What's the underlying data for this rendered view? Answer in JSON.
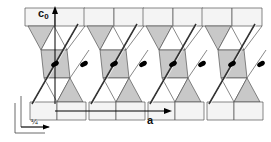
{
  "figure": {
    "type": "crystal-structure-polyhedral-projection",
    "axis_labels": {
      "c_axis": "c",
      "c_axis_subscript": "0",
      "a_axis": "a",
      "fraction_label": "¼"
    },
    "colors": {
      "shaded_polyhedra": "#c8c8c8",
      "light_polyhedra": "#f4f4f4",
      "edges": "#555555",
      "cation_ellipses": "#000000",
      "axes": "#000000"
    },
    "repeat_units": 4,
    "cation_sites_per_unit": 2
  }
}
